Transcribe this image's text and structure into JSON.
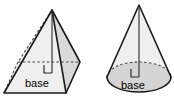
{
  "figure": {
    "background_color": "#ffffff",
    "outline_color": "#1a1a1a",
    "hidden_edge_color": "#4a4a4a",
    "face_fill_color": "#d9d9d9",
    "base_fill_color": "#d4d4d4",
    "label_color": "#000000"
  },
  "shapes": [
    {
      "id": "pyramid",
      "name": "square-pyramid",
      "base_label": "base",
      "apex": {
        "x": 52,
        "y": 10
      },
      "base_vertices": [
        {
          "name": "front-left",
          "x": 4,
          "y": 93
        },
        {
          "name": "front-right",
          "x": 66,
          "y": 93
        },
        {
          "name": "right-rear",
          "x": 80,
          "y": 62
        },
        {
          "name": "left-rear",
          "x": 18,
          "y": 62
        }
      ],
      "altitude": {
        "from_x": 52,
        "from_y": 10,
        "to_x": 52,
        "to_y": 73
      },
      "right_angle_mark": {
        "x": 44,
        "y": 65,
        "size": 8
      },
      "label_position": {
        "x": 25,
        "y": 87
      }
    },
    {
      "id": "cone",
      "name": "circular-cone",
      "base_label": "base",
      "apex": {
        "x": 139,
        "y": 5
      },
      "base_ellipse": {
        "cx": 139,
        "cy": 77,
        "rx": 32,
        "ry": 15
      },
      "altitude": {
        "from_x": 139,
        "from_y": 5,
        "to_x": 139,
        "to_y": 77
      },
      "right_angle_mark": {
        "x": 131,
        "y": 69,
        "size": 8
      },
      "label_position": {
        "x": 121,
        "y": 89
      }
    }
  ]
}
